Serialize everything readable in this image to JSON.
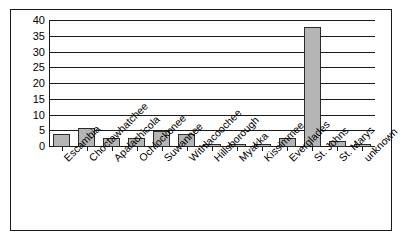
{
  "chart_data": {
    "type": "bar",
    "title": "",
    "subtitle": "",
    "xlabel": "",
    "ylabel": "",
    "ylim": [
      0,
      40
    ],
    "ytick_step": 5,
    "yticks": [
      40,
      35,
      30,
      25,
      20,
      15,
      10,
      5,
      0
    ],
    "grid": true,
    "legend": false,
    "legend_position": "none",
    "categories": [
      "Escambia",
      "Choctawhatchee",
      "Apalachicola",
      "Ochlockonee",
      "Suwannee",
      "Withlacoochee",
      "Hillsborough",
      "Myakka",
      "Kissimmee",
      "Everglades",
      "St. Johns",
      "St. Marys",
      "unknown"
    ],
    "values": [
      4,
      6,
      3,
      3,
      5,
      4,
      1,
      1,
      1,
      3,
      38,
      2,
      1
    ],
    "colors": {
      "bar_fill": "#b5b5b5",
      "bar_border": "#2b2b2b",
      "axis": "#1a1a1a",
      "grid": "#1a1a1a",
      "background": "#ffffff",
      "frame": "#1a1a1a"
    }
  }
}
